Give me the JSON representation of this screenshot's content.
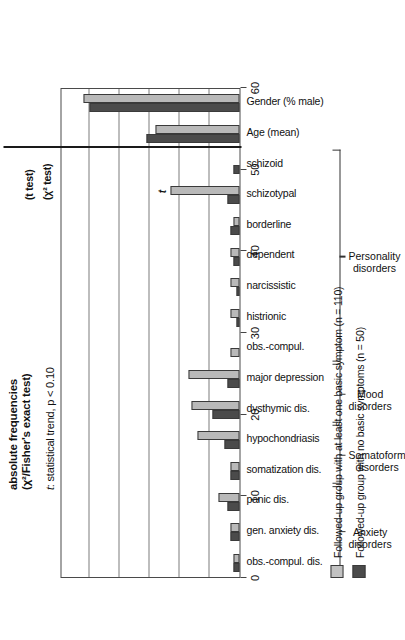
{
  "header": {
    "note_bold": "absolute frequencies\n(χ²/Fisher's exact test)",
    "note_bold_line1": "absolute frequencies",
    "note_bold_line2": "(χ²/Fisher's exact test)",
    "note_italic_prefix": "t",
    "note_italic_rest": ": statistical trend, p < 0.10",
    "t_test_label": "(t test)",
    "chi_test_label": "(χ² test)"
  },
  "legend": {
    "position": "bottom-left",
    "items": [
      {
        "label": "Followed-up group with at least one basic symptom (n = 110)",
        "color": "#c2c2c2",
        "key": "at-least-one-basic-symptom"
      },
      {
        "label": "Followed-up group with no basic symptoms (n = 50)",
        "color": "#4b4b4b",
        "key": "no-basic-symptoms"
      }
    ]
  },
  "groups": [
    {
      "name": "Anxiety\ndisorders",
      "line1": "Anxiety",
      "line2": "disorders",
      "start": 0,
      "end": 2
    },
    {
      "name": "Somatoform\ndisorders",
      "line1": "Somatoform",
      "line2": "disorders",
      "start": 3,
      "end": 4
    },
    {
      "name": "Mood\ndisorders",
      "line1": "Mood",
      "line2": "disorders",
      "start": 5,
      "end": 6
    },
    {
      "name": "Personality\ndisorders",
      "line1": "Personality",
      "line2": "disorders",
      "start": 7,
      "end": 13
    }
  ],
  "annotations": [
    {
      "category": "schizotypal",
      "symbol": "t",
      "meaning": "statistical trend, p < 0.10"
    }
  ],
  "chart_data": {
    "type": "bar",
    "orientation": "horizontal",
    "title": "",
    "xlabel": "",
    "ylabel": "",
    "ylim": [
      0,
      60
    ],
    "yticks": [
      0,
      10,
      20,
      30,
      40,
      50,
      60
    ],
    "ticklabels": [
      "0",
      "10",
      "20",
      "30",
      "40",
      "50",
      "60"
    ],
    "grid": true,
    "categories": [
      "obs.-compul. dis.",
      "gen. anxiety dis.",
      "panic dis.",
      "somatization dis.",
      "hypochondriasis",
      "dysthymic dis.",
      "major depression",
      "obs.-compul.",
      "histrionic",
      "narcissistic",
      "dependent",
      "borderline",
      "schizotypal",
      "schizoid",
      "Age (mean)",
      "Gender (% male)"
    ],
    "series": [
      {
        "name": "Followed-up group with no basic symptoms (n = 50)",
        "color": "#4b4b4b",
        "values": [
          2,
          3,
          4,
          3,
          5,
          9,
          4,
          0,
          1,
          1,
          2,
          3,
          4,
          2,
          31,
          50
        ]
      },
      {
        "name": "Followed-up group with at least one basic symptom (n = 110)",
        "color": "#c2c2c2",
        "values": [
          2,
          3,
          7,
          3,
          14,
          16,
          17,
          3,
          3,
          3,
          3,
          2,
          23,
          0,
          28,
          52
        ]
      }
    ]
  }
}
